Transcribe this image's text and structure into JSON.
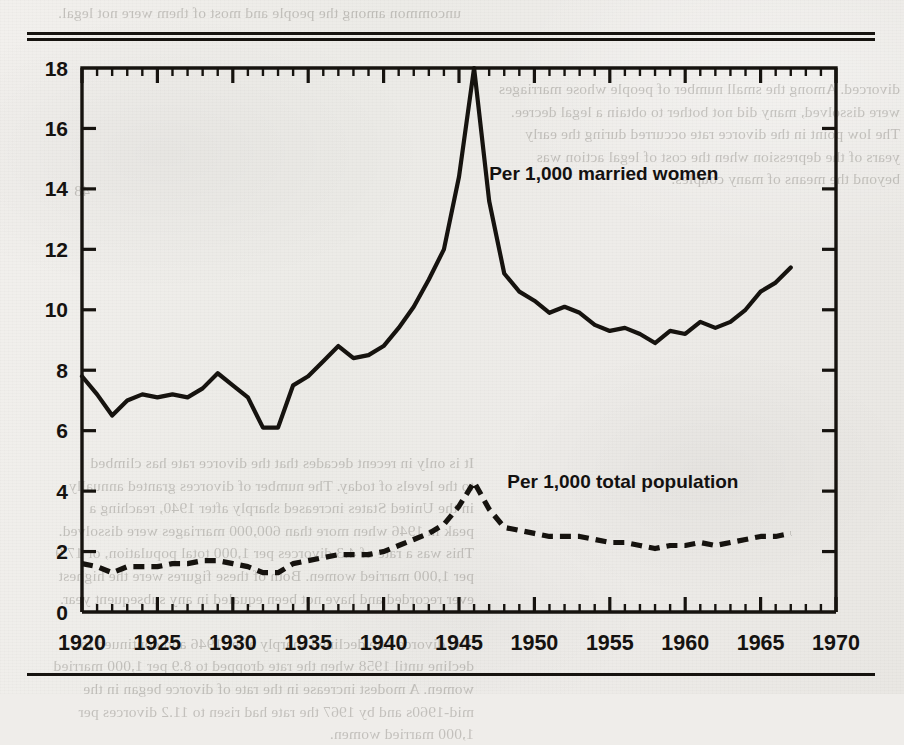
{
  "page": {
    "background_color": "#efedea",
    "ink_color": "#16130f",
    "top_rule": "double",
    "bottom_rule": "single",
    "bleed_through_text": {
      "top": "uncommon among the people and most of them were not legal.",
      "right": "divorced. Among the small number of people whose marriages\nwere dissolved, many did not bother to obtain a legal decree.\nThe low point in the divorce rate occurred during the early\nyears of the depression when the cost of legal action was\nbeyond the means of many couples.",
      "left": "48",
      "bottom": "It is only in recent decades that the divorce rate has climbed\nto the levels of today. The number of divorces granted annually\nin the United States increased sharply after 1940, reaching a\npeak in 1946 when more than 600,000 marriages were dissolved.\nThis was a rate of 4.3 divorces per 1,000 total population, or 17.9\nper 1,000 married women. Both of these figures were the highest\never recorded and have not been equaled in any subsequent year.\n\nThe divorce rate declined sharply after 1946 and continued to\ndecline until 1958 when the rate dropped to 8.9 per 1,000 married\nwomen. A modest increase in the rate of divorce began in the\nmid-1960s and by 1967 the rate had risen to 11.2 divorces per\n1,000 married women."
    }
  },
  "chart_data": {
    "type": "line",
    "title": "",
    "xlabel": "",
    "ylabel": "",
    "xlim": [
      1920,
      1970
    ],
    "ylim": [
      0,
      18
    ],
    "xticks_major": [
      1920,
      1925,
      1930,
      1935,
      1940,
      1945,
      1950,
      1955,
      1960,
      1965,
      1970
    ],
    "xticks_major_labels": [
      "1920",
      "1925",
      "1930",
      "1935",
      "1940",
      "1945",
      "1950",
      "1955",
      "1960",
      "1965",
      "1970"
    ],
    "xtick_minor_step": 1,
    "yticks": [
      0,
      2,
      4,
      6,
      8,
      10,
      12,
      14,
      16,
      18
    ],
    "ytick_labels": [
      "0",
      "2",
      "4",
      "6",
      "8",
      "10",
      "12",
      "14",
      "16",
      "18"
    ],
    "grid": false,
    "legend_position": "inline-annotation",
    "x": [
      1920,
      1921,
      1922,
      1923,
      1924,
      1925,
      1926,
      1927,
      1928,
      1929,
      1930,
      1931,
      1932,
      1933,
      1934,
      1935,
      1936,
      1937,
      1938,
      1939,
      1940,
      1941,
      1942,
      1943,
      1944,
      1945,
      1946,
      1947,
      1948,
      1949,
      1950,
      1951,
      1952,
      1953,
      1954,
      1955,
      1956,
      1957,
      1958,
      1959,
      1960,
      1961,
      1962,
      1963,
      1964,
      1965,
      1966,
      1967
    ],
    "series": [
      {
        "name": "Per 1,000 married women",
        "style": "solid",
        "label": "Per 1,000 married women",
        "label_x": 1947.0,
        "label_y": 14.3,
        "values": [
          7.8,
          7.2,
          6.5,
          7.0,
          7.2,
          7.1,
          7.2,
          7.1,
          7.4,
          7.9,
          7.5,
          7.1,
          6.1,
          6.1,
          7.5,
          7.8,
          8.3,
          8.8,
          8.4,
          8.5,
          8.8,
          9.4,
          10.1,
          11.0,
          12.0,
          14.4,
          18.0,
          13.6,
          11.2,
          10.6,
          10.3,
          9.9,
          10.1,
          9.9,
          9.5,
          9.3,
          9.4,
          9.2,
          8.9,
          9.3,
          9.2,
          9.6,
          9.4,
          9.6,
          10.0,
          10.6,
          10.9,
          11.4
        ]
      },
      {
        "name": "Per 1,000 total population",
        "style": "dashed",
        "label": "Per 1,000 total population",
        "label_x": 1948.2,
        "label_y": 4.1,
        "values": [
          1.6,
          1.5,
          1.3,
          1.5,
          1.5,
          1.5,
          1.6,
          1.6,
          1.7,
          1.7,
          1.6,
          1.5,
          1.3,
          1.3,
          1.6,
          1.7,
          1.8,
          1.9,
          1.9,
          1.9,
          2.0,
          2.2,
          2.4,
          2.6,
          2.9,
          3.5,
          4.3,
          3.4,
          2.8,
          2.7,
          2.6,
          2.5,
          2.5,
          2.5,
          2.4,
          2.3,
          2.3,
          2.2,
          2.1,
          2.2,
          2.2,
          2.3,
          2.2,
          2.3,
          2.4,
          2.5,
          2.5,
          2.6
        ]
      }
    ]
  }
}
